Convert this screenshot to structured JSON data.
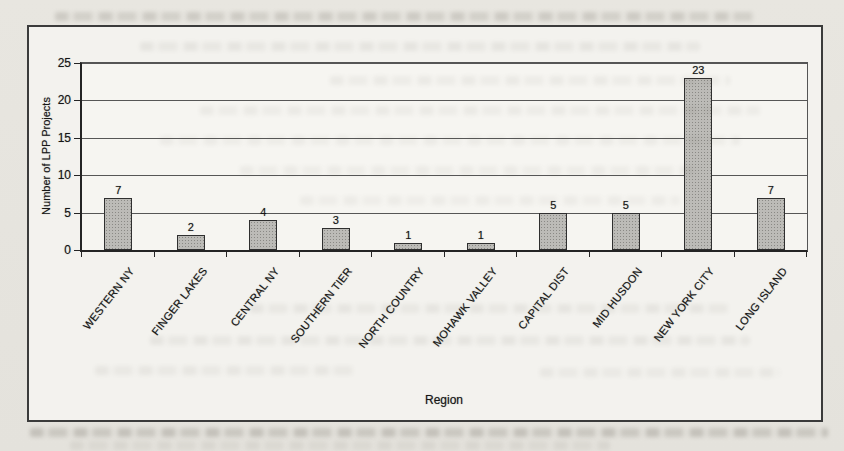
{
  "chart_data": {
    "type": "bar",
    "title": "",
    "xlabel": "Region",
    "ylabel": "Number of LPP Projects",
    "categories": [
      "WESTERN NY",
      "FINGER LAKES",
      "CENTRAL NY",
      "SOUTHERN TIER",
      "NORTH COUNTRY",
      "MOHAWK VALLEY",
      "CAPITAL DIST",
      "MID HUSDON",
      "NEW YORK CITY",
      "LONG ISLAND"
    ],
    "values": [
      7,
      2,
      4,
      3,
      1,
      1,
      5,
      5,
      23,
      7
    ],
    "ylim": [
      0,
      25
    ],
    "yticks": [
      0,
      5,
      10,
      15,
      20,
      25
    ],
    "grid": true,
    "legend_position": "none",
    "bar_value_labels_shown": true,
    "colors": {
      "bar_fill": "#bcbbb7",
      "bar_border": "#2f2f2f",
      "grid_line": "#565656",
      "axis_line": "#242424",
      "text": "#161616",
      "chart_background": "#f3f2ee",
      "page_background": "#e6e3dd"
    }
  }
}
